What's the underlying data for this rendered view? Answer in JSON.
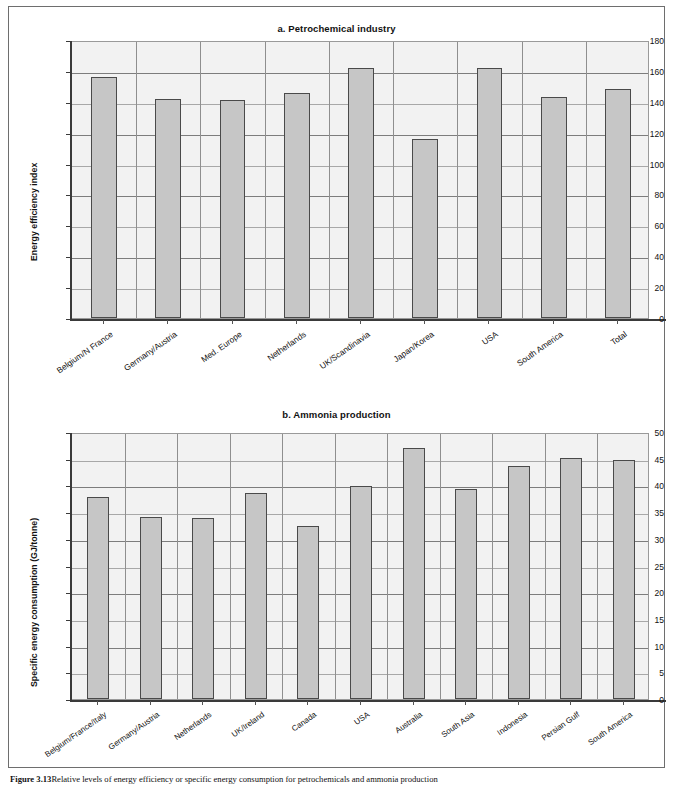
{
  "figure": {
    "caption_label": "Figure 3.13",
    "caption_text": "Relative levels of energy efficiency or specific energy consumption for petrochemicals and ammonia production"
  },
  "chart_data": [
    {
      "id": "a",
      "type": "bar",
      "title": "a. Petrochemical industry",
      "xlabel": "",
      "ylabel": "Energy efficiency index",
      "ylim": [
        0,
        180
      ],
      "ytick_step": 20,
      "yticks": [
        "0",
        "20",
        "40",
        "60",
        "80",
        "100",
        "120",
        "140",
        "160",
        "180"
      ],
      "grid": true,
      "legend": "none",
      "bar_color": "#c6c6c6",
      "bar_border_color": "#4a4a4a",
      "plot_bg": "#f2f2f2",
      "categories": [
        "Belgium/N France",
        "Germany/Austria",
        "Med. Europe",
        "Netherlands",
        "UK/Scandinavia",
        "Japan/Korea",
        "USA",
        "South America",
        "Total"
      ],
      "values": [
        156,
        142,
        141,
        146,
        162,
        116,
        162,
        143,
        148
      ]
    },
    {
      "id": "b",
      "type": "bar",
      "title": "b. Ammonia production",
      "xlabel": "",
      "ylabel": "Specific energy consumption (GJ/tonne)",
      "ylim": [
        0,
        50
      ],
      "ytick_step": 5,
      "yticks": [
        "0",
        "5",
        "10",
        "15",
        "20",
        "25",
        "30",
        "35",
        "40",
        "45",
        "50"
      ],
      "grid": true,
      "legend": "none",
      "bar_color": "#c6c6c6",
      "bar_border_color": "#4a4a4a",
      "plot_bg": "#f2f2f2",
      "categories": [
        "Belgium/France/Italy",
        "Germany/Austria",
        "Netherlands",
        "UK/Ireland",
        "Canada",
        "USA",
        "Australia",
        "South Asia",
        "Indonesia",
        "Persian Gulf",
        "South America"
      ],
      "values": [
        37.8,
        34.1,
        33.9,
        38.5,
        32.4,
        39.9,
        47.1,
        39.4,
        43.7,
        45.2,
        44.7
      ]
    }
  ]
}
